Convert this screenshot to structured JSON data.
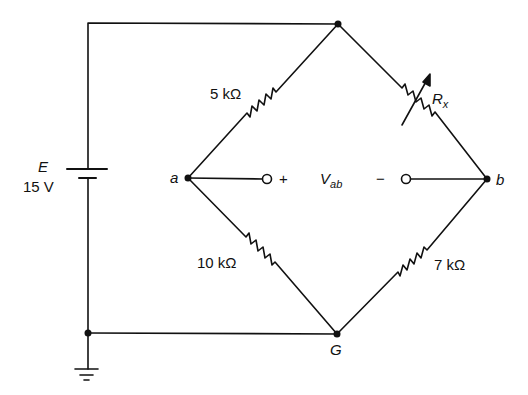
{
  "diagram": {
    "type": "wheatstone-bridge-circuit",
    "colors": {
      "line": "#111111",
      "background": "#ffffff"
    },
    "source": {
      "symbol": "E",
      "value": "15 V"
    },
    "nodes": {
      "a": "a",
      "b": "b",
      "ground": "G"
    },
    "resistors": {
      "top_left": "5 kΩ",
      "top_right_symbol": "R",
      "top_right_subscript": "x",
      "bottom_left": "10 kΩ",
      "bottom_right": "7 kΩ"
    },
    "output": {
      "plus": "+",
      "minus": "−",
      "symbol": "V",
      "subscript": "ab"
    }
  }
}
